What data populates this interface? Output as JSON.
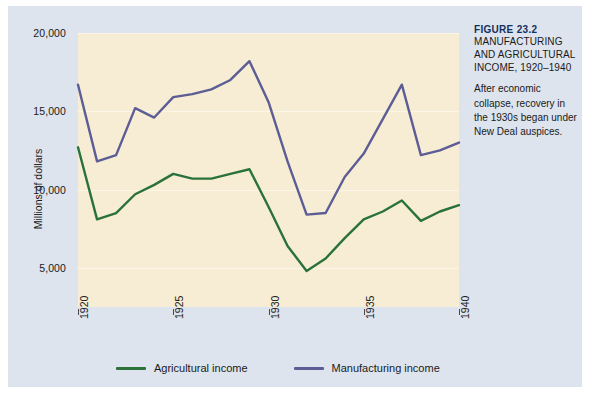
{
  "caption": {
    "figure_number": "FIGURE 23.2",
    "title": "MANUFACTURING AND AGRICULTURAL INCOME, 1920–1940",
    "body": "After economic collapse, recovery in the 1930s began under New Deal auspices."
  },
  "colors": {
    "panel_background": "#dde4ee",
    "plot_background": "#f6edd4",
    "gridline": "#fbf6e6",
    "agricultural": "#2a7239",
    "manufacturing": "#5d5d96",
    "figure_number_text": "#14305c",
    "axis_text": "#1a1a1a"
  },
  "chart_data": {
    "type": "line",
    "title": "MANUFACTURING AND AGRICULTURAL INCOME, 1920–1940",
    "xlabel": "",
    "ylabel": "Millions of dollars",
    "xlim": [
      1920,
      1940
    ],
    "ylim": [
      2500,
      20000
    ],
    "grid": true,
    "legend_position": "bottom",
    "x": [
      1920,
      1921,
      1922,
      1923,
      1924,
      1925,
      1926,
      1927,
      1928,
      1929,
      1930,
      1931,
      1932,
      1933,
      1934,
      1935,
      1936,
      1937,
      1938,
      1939,
      1940
    ],
    "x_tick_labels": [
      "1920",
      "1925",
      "1930",
      "1935",
      "1940"
    ],
    "x_ticks": [
      1920,
      1925,
      1930,
      1935,
      1940
    ],
    "y_ticks": [
      5000,
      10000,
      15000,
      20000
    ],
    "y_tick_labels": [
      "5,000",
      "10,000",
      "15,000",
      "20,000"
    ],
    "series": [
      {
        "name": "Agricultural income",
        "color": "#2a7239",
        "values": [
          12700,
          8100,
          8500,
          9700,
          10300,
          11000,
          10700,
          10700,
          11000,
          11300,
          8900,
          6400,
          4800,
          5600,
          6900,
          8100,
          8600,
          9300,
          8000,
          8600,
          9000
        ]
      },
      {
        "name": "Manufacturing income",
        "color": "#5d5d96",
        "values": [
          16700,
          11800,
          12200,
          15200,
          14600,
          15900,
          16100,
          16400,
          17000,
          18200,
          15600,
          11800,
          8400,
          8500,
          10800,
          12300,
          14500,
          16700,
          12200,
          12500,
          13000
        ]
      }
    ]
  }
}
